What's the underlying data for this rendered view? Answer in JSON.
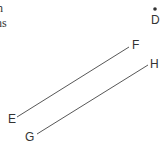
{
  "text_fragments": [
    "n",
    "ns"
  ],
  "points": {
    "D": {
      "label": "D",
      "x": 155,
      "y": 9
    }
  },
  "labels": {
    "D": "D",
    "E": "E",
    "F": "F",
    "G": "G",
    "H": "H"
  },
  "segments": [
    {
      "name": "EF",
      "from": "E",
      "to": "F",
      "x1": 17,
      "y1": 117,
      "x2": 129,
      "y2": 47
    },
    {
      "name": "GH",
      "from": "G",
      "to": "H",
      "x1": 37,
      "y1": 134,
      "x2": 148,
      "y2": 65
    }
  ],
  "colors": {
    "stroke": "#444444",
    "text": "#333333",
    "background": "#ffffff"
  }
}
